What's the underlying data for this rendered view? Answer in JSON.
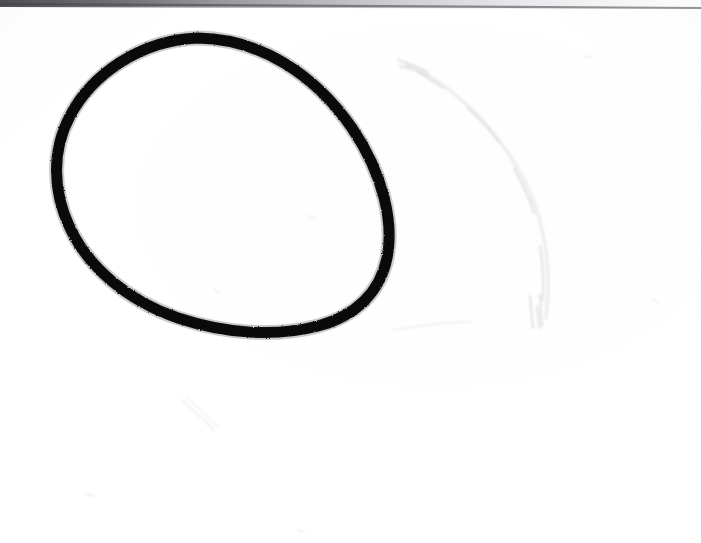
{
  "document": {
    "kind": "scanned-paper-sheet",
    "title": "Hand-drawn oval on white paper",
    "width": 701,
    "height": 543,
    "background_color": "#ffffff",
    "paper_tone": "#fdfdfd"
  },
  "artwork": {
    "primary_shape": {
      "name": "hand-drawn-oval",
      "description": "Thick black closed freehand oval, egg shaped and tilted, open end toward lower right",
      "stroke_color": "#0c0c0c",
      "stroke_width_px": 11,
      "fill": "none",
      "bounding_box": {
        "x": 52,
        "y": 36,
        "width": 340,
        "height": 300
      },
      "path": "M 198 38 C 262 39 316 76 352 128 C 384 175 394 224 387 258 C 380 292 356 316 318 326 C 276 337 226 334 178 318 C 128 301 89 268 70 228 C 52 190 52 150 70 116 C 92 74 141 40 198 38 Z"
    },
    "ghost_arc": {
      "name": "erased-ghost-arc",
      "description": "Very faint partially erased pencil arc to the right of the oval",
      "stroke_color": "#ececee",
      "stroke_width_px": 3,
      "path": "M 404 62 C 452 84 492 124 520 172 C 546 218 552 272 546 318"
    },
    "ghost_arc_highlight": {
      "name": "erased-ghost-arc-highlight",
      "stroke_color": "#e2e2e6",
      "path": "M 407 66 C 420 73 432 80 443 88 M 468 108 C 480 119 490 130 499 142 M 514 168 C 522 183 529 198 534 213 M 540 246 C 543 264 544 282 543 300 M 537 306 C 538 315 539 322 539 328"
    },
    "smudges": [
      {
        "name": "smudge-lower-left-diagonal",
        "path": "M 182 400 C 192 409 203 419 214 430",
        "stroke_color": "#f0f0f2",
        "stroke_width_px": 2
      },
      {
        "name": "smudge-lower-left-diagonal-second",
        "path": "M 188 398 C 199 408 209 419 219 428",
        "stroke_color": "#f3f3f5",
        "stroke_width_px": 2
      },
      {
        "name": "smudge-below-oval-horizontal",
        "path": "M 394 330 C 420 325 446 322 470 322",
        "stroke_color": "#f2f2f4",
        "stroke_width_px": 2
      },
      {
        "name": "smudge-speck-left-bottom",
        "path": "M 86 494 L 94 496",
        "stroke_color": "#eeeef0",
        "stroke_width_px": 2
      },
      {
        "name": "smudge-speck-inside-oval",
        "path": "M 214 290 L 219 292",
        "stroke_color": "#eeeef0",
        "stroke_width_px": 2
      },
      {
        "name": "smudge-speck-upper-inside",
        "path": "M 308 216 L 314 219",
        "stroke_color": "#f1f1f3",
        "stroke_width_px": 2
      },
      {
        "name": "smudge-speck-right-mid",
        "path": "M 652 300 L 658 302",
        "stroke_color": "#f2f2f4",
        "stroke_width_px": 2
      },
      {
        "name": "smudge-speck-bottom-center",
        "path": "M 298 530 L 304 532",
        "stroke_color": "#f3f3f5",
        "stroke_width_px": 2
      }
    ],
    "scan_edge": {
      "name": "scan-edge-top",
      "description": "Dark slanted page or scanner lid edge across the very top, darkest at left and fading to the right",
      "color_left": "#4a4a4e",
      "color_right": "#d8d8dc",
      "y_left": 2,
      "y_right": 7
    }
  }
}
